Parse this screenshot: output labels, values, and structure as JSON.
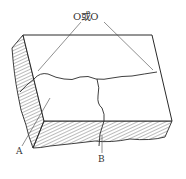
{
  "diagram": {
    "top_label": "O或O",
    "label_a": "A",
    "label_b": "B",
    "colors": {
      "stroke": "#2a2a2a",
      "hatch": "#555555",
      "leader": "#444444",
      "background": "#ffffff"
    }
  }
}
